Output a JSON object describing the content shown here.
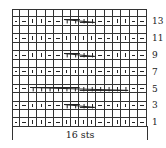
{
  "chart_data": {
    "type": "table",
    "columns": 16,
    "rows": 14,
    "stitch_count_label": "16 sts",
    "row_labels": [
      "13",
      "11",
      "9",
      "7",
      "5",
      "3",
      "1"
    ],
    "legend_symbols": {
      "P": "purl (horizontal dash)",
      "K": "knit (vertical bar)",
      "C4": "4-stitch cable cross",
      "C12": "12-stitch cable cross",
      "": "blank (even/wrong-side row)"
    },
    "grid_top_to_bottom": [
      {
        "row": 14,
        "cells": [
          "",
          "",
          "",
          "",
          "",
          "",
          "",
          "",
          "",
          "",
          "",
          "",
          "",
          "",
          "",
          ""
        ]
      },
      {
        "row": 13,
        "cells": [
          "P",
          "P",
          "K",
          "K",
          "P",
          "P",
          "C4",
          "C4",
          "C4",
          "C4",
          "P",
          "P",
          "K",
          "K",
          "P",
          "P"
        ]
      },
      {
        "row": 12,
        "cells": [
          "",
          "",
          "",
          "",
          "",
          "",
          "",
          "",
          "",
          "",
          "",
          "",
          "",
          "",
          "",
          ""
        ]
      },
      {
        "row": 11,
        "cells": [
          "P",
          "P",
          "K",
          "K",
          "P",
          "P",
          "K",
          "K",
          "K",
          "K",
          "P",
          "P",
          "K",
          "K",
          "P",
          "P"
        ]
      },
      {
        "row": 10,
        "cells": [
          "",
          "",
          "",
          "",
          "",
          "",
          "",
          "",
          "",
          "",
          "",
          "",
          "",
          "",
          "",
          ""
        ]
      },
      {
        "row": 9,
        "cells": [
          "P",
          "P",
          "K",
          "K",
          "P",
          "P",
          "C4",
          "C4",
          "C4",
          "C4",
          "P",
          "P",
          "K",
          "K",
          "P",
          "P"
        ]
      },
      {
        "row": 8,
        "cells": [
          "",
          "",
          "",
          "",
          "",
          "",
          "",
          "",
          "",
          "",
          "",
          "",
          "",
          "",
          "",
          ""
        ]
      },
      {
        "row": 7,
        "cells": [
          "P",
          "P",
          "K",
          "K",
          "P",
          "P",
          "K",
          "K",
          "K",
          "K",
          "P",
          "P",
          "K",
          "K",
          "P",
          "P"
        ]
      },
      {
        "row": 6,
        "cells": [
          "",
          "",
          "",
          "",
          "",
          "",
          "",
          "",
          "",
          "",
          "",
          "",
          "",
          "",
          "",
          ""
        ]
      },
      {
        "row": 5,
        "cells": [
          "P",
          "P",
          "C12",
          "C12",
          "C12",
          "C12",
          "C12",
          "C12",
          "C12",
          "C12",
          "C12",
          "C12",
          "C12",
          "C12",
          "P",
          "P"
        ]
      },
      {
        "row": 4,
        "cells": [
          "",
          "",
          "",
          "",
          "",
          "",
          "",
          "",
          "",
          "",
          "",
          "",
          "",
          "",
          "",
          ""
        ]
      },
      {
        "row": 3,
        "cells": [
          "P",
          "P",
          "K",
          "K",
          "P",
          "P",
          "C4",
          "C4",
          "C4",
          "C4",
          "P",
          "P",
          "K",
          "K",
          "P",
          "P"
        ]
      },
      {
        "row": 2,
        "cells": [
          "",
          "",
          "",
          "",
          "",
          "",
          "",
          "",
          "",
          "",
          "",
          "",
          "",
          "",
          "",
          ""
        ]
      },
      {
        "row": 1,
        "cells": [
          "P",
          "P",
          "K",
          "K",
          "P",
          "P",
          "K",
          "K",
          "K",
          "K",
          "P",
          "P",
          "K",
          "K",
          "P",
          "P"
        ]
      }
    ],
    "cables": [
      {
        "row": 13,
        "start_col": 7,
        "end_col": 10
      },
      {
        "row": 9,
        "start_col": 7,
        "end_col": 10
      },
      {
        "row": 5,
        "start_col": 3,
        "end_col": 14
      },
      {
        "row": 3,
        "start_col": 7,
        "end_col": 10
      }
    ]
  },
  "labels": {
    "r13": "13",
    "r11": "11",
    "r9": "9",
    "r7": "7",
    "r5": "5",
    "r3": "3",
    "r1": "1",
    "sts": "16 sts"
  }
}
